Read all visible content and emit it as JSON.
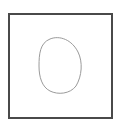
{
  "canvas": {
    "background": "#ffffff",
    "frame_color": "#4a4a4a",
    "shape_stroke": "#9a9a9a",
    "shape": "closed-blob"
  }
}
